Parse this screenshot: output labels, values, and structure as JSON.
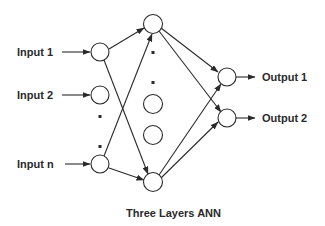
{
  "diagram": {
    "caption": "Three Layers ANN",
    "colors": {
      "stroke": "#2a2a2a",
      "background": "#ffffff",
      "text": "#2a2a2a"
    },
    "input_labels": [
      "Input 1",
      "Input 2",
      "Input n"
    ],
    "output_labels": [
      "Output 1",
      "Output 2"
    ],
    "layers": {
      "input": {
        "nodes": [
          "Input 1",
          "Input 2",
          "ellipsis",
          "Input n"
        ]
      },
      "hidden": {
        "nodes": [
          "h1",
          "ellipsis",
          "h_mid1",
          "h_mid2",
          "h_last"
        ]
      },
      "output": {
        "nodes": [
          "Output 1",
          "Output 2"
        ]
      }
    }
  }
}
